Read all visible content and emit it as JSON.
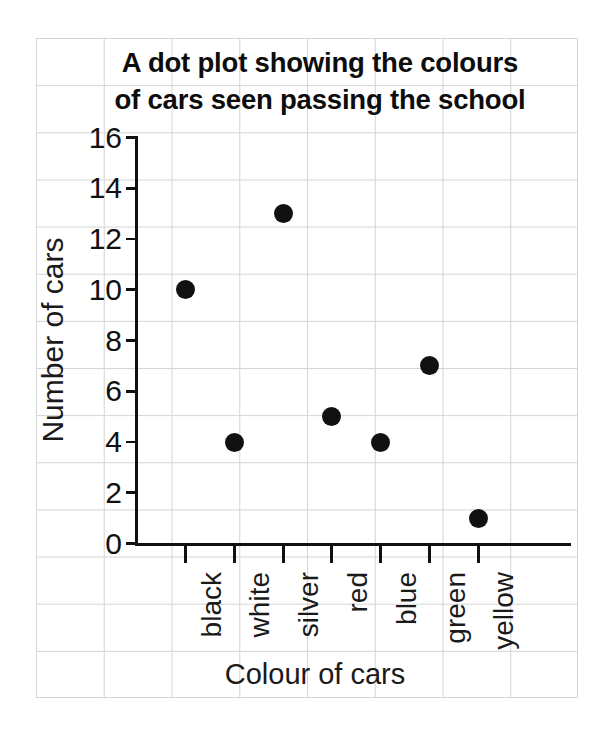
{
  "chart_data": {
    "type": "scatter",
    "title": "A dot plot showing the colours\nof cars seen passing the school",
    "xlabel": "Colour of cars",
    "ylabel": "Number of cars",
    "categories": [
      "black",
      "white",
      "silver",
      "red",
      "blue",
      "green",
      "yellow"
    ],
    "values": [
      10,
      4,
      13,
      5,
      4,
      7,
      1
    ],
    "ylim": [
      0,
      16
    ],
    "ytick_labels": [
      "0",
      "2",
      "4",
      "6",
      "8",
      "10",
      "12",
      "14",
      "16"
    ],
    "ytick_values": [
      0,
      2,
      4,
      6,
      8,
      10,
      12,
      14,
      16
    ],
    "grid": true,
    "legend": "none",
    "marker_color": "#111111",
    "axis_color": "#111111",
    "grid_color": "#d4d4d4",
    "background_color": "#ffffff"
  }
}
